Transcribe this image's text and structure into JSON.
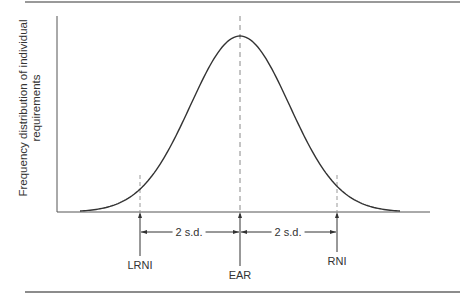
{
  "chart_data": {
    "type": "line",
    "title": "",
    "xlabel": "",
    "ylabel": "Frequency distribution of individual requirements",
    "ylabel_lines": [
      "Frequency distribution of individual",
      "requirements"
    ],
    "series": [
      {
        "name": "Normal distribution of requirements",
        "shape": "gaussian",
        "mean": "EAR",
        "sd_units": 1
      }
    ],
    "markers": [
      {
        "label": "LRNI",
        "position_sd": -2
      },
      {
        "label": "EAR",
        "position_sd": 0
      },
      {
        "label": "RNI",
        "position_sd": 2
      }
    ],
    "annotations": [
      {
        "text": "2 s.d.",
        "from": "LRNI",
        "to": "EAR"
      },
      {
        "text": "2 s.d.",
        "from": "EAR",
        "to": "RNI"
      }
    ],
    "grid": false,
    "legend": "none"
  },
  "labels": {
    "ylabel_line1": "Frequency distribution of individual",
    "ylabel_line2": "requirements",
    "lrni": "LRNI",
    "ear": "EAR",
    "rni": "RNI",
    "sd_left": "2 s.d.",
    "sd_right": "2 s.d."
  },
  "colors": {
    "curve": "#333333",
    "axis": "#555555",
    "rule": "#666666",
    "dashed": "#888888"
  }
}
